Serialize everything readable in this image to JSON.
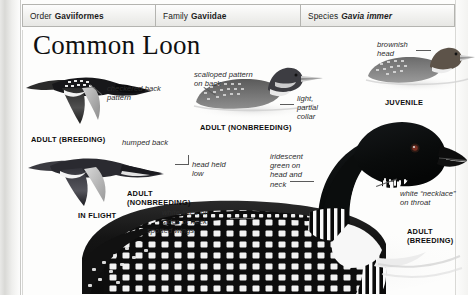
{
  "taxonomy": {
    "order": {
      "label": "Order",
      "value": "Gaviiformes"
    },
    "family": {
      "label": "Family",
      "value": "Gaviidae"
    },
    "species": {
      "label": "Species",
      "value": "Gavia immer"
    }
  },
  "plate": {
    "title": "Common Loon"
  },
  "annotations": {
    "checkered_back": "checkered back\npattern",
    "humped_back": "humped back",
    "head_held_low": "head held\nlow",
    "scalloped_pattern": "scalloped pattern\non back",
    "light_partial_collar": "light,\npartial\ncollar",
    "brownish_head": "brownish\nhead",
    "iridescent_green": "iridescent\ngreen on\nhead and\nneck",
    "white_lines_neck": "white lines on\nsides of neck",
    "white_necklace": "white “necklace”\non throat",
    "spotted_wings": "spotted wings"
  },
  "captions": {
    "adult_breeding_flight": "ADULT (BREEDING)",
    "adult_nonbreeding_flight": "ADULT\n(NONBREEDING)",
    "in_flight": "IN FLIGHT",
    "adult_nonbreeding_swim": "ADULT (NONBREEDING)",
    "juvenile": "JUVENILE",
    "adult_breeding_large": "ADULT\n(BREEDING)"
  },
  "colors": {
    "page_background": "#fdfdfc",
    "header_border": "#b4b4b0",
    "text": "#1b1b1b",
    "leader_line": "#5b5b5b",
    "plumage_dark": "#141414",
    "plumage_mid": "#6f6f6f",
    "plumage_light": "#d2d2d2"
  }
}
